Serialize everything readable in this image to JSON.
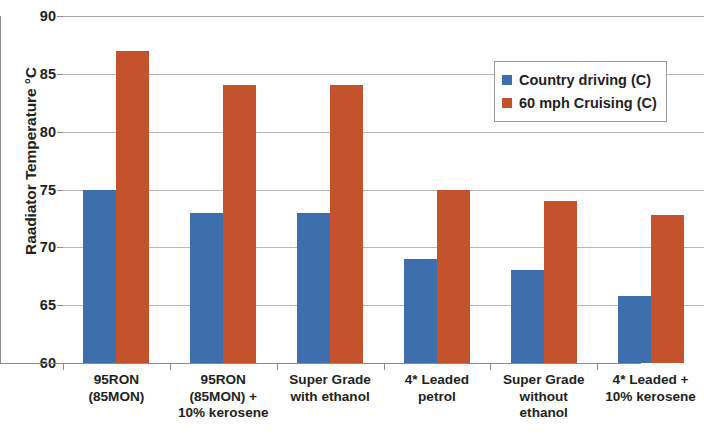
{
  "chart_data": {
    "type": "bar",
    "title": "",
    "xlabel": "",
    "ylabel": "Raadiator Temperature °C",
    "ylim": [
      60,
      90
    ],
    "ytick_interval": 5,
    "ytick_labels": [
      "90",
      "85",
      "80",
      "75",
      "70",
      "65",
      "60"
    ],
    "ytick_values": [
      90,
      85,
      80,
      75,
      70,
      65,
      60
    ],
    "grid": true,
    "legend_position": "upper right",
    "categories": [
      "95RON\n(85MON)",
      "95RON\n(85MON) +\n10% kerosene",
      "Super Grade\nwith ethanol",
      "4* Leaded\npetrol",
      "Super Grade\nwithout\nethanol",
      "4* Leaded +\n10% kerosene"
    ],
    "category_lines": [
      [
        "95RON",
        "(85MON)"
      ],
      [
        "95RON",
        "(85MON) +",
        "10% kerosene"
      ],
      [
        "Super Grade",
        "with ethanol"
      ],
      [
        "4* Leaded",
        "petrol"
      ],
      [
        "Super Grade",
        "without",
        "ethanol"
      ],
      [
        "4* Leaded +",
        "10% kerosene"
      ]
    ],
    "series": [
      {
        "name": "Country driving (C)",
        "color": "#3d6fad",
        "values": [
          75,
          73,
          73,
          69,
          68,
          65.8
        ]
      },
      {
        "name": "60 mph Cruising (C)",
        "color": "#c4532d",
        "values": [
          87,
          84,
          84,
          75,
          74,
          72.8
        ]
      }
    ]
  },
  "legend": {
    "entries": [
      {
        "label": "Country driving (C)",
        "color": "#3d6fad"
      },
      {
        "label": "60 mph Cruising (C)",
        "color": "#c4532d"
      }
    ]
  }
}
